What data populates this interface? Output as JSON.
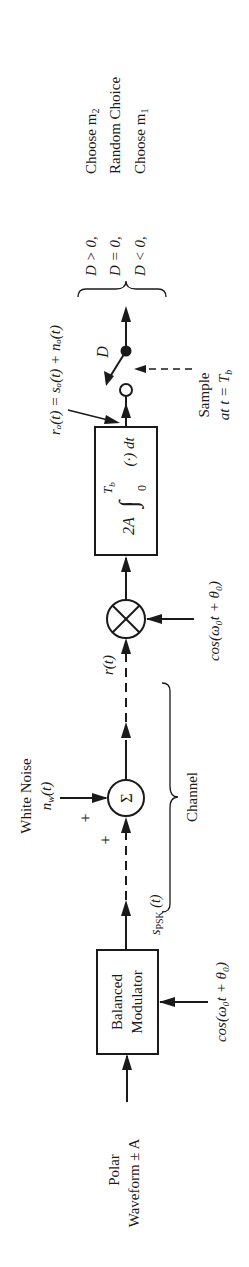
{
  "figure": {
    "orientation": "rotated-90-ccw",
    "input": {
      "label_line1": "Polar",
      "label_line2": "Waveform ± A"
    },
    "modulator": {
      "label_line1": "Balanced",
      "label_line2": "Modulator",
      "carrier": "cos(ω₀t + θ₀)"
    },
    "channel": {
      "label": "Channel",
      "transmitted_signal": "s",
      "transmitted_subscript": "PSK",
      "transmitted_arg": " (t)",
      "noise_title": "White Noise",
      "noise_symbol": "n",
      "noise_subscript": "w",
      "noise_arg": "(t)",
      "sum_symbol": "Σ",
      "plus_noise": "+",
      "plus_signal": "+"
    },
    "receiver": {
      "received_signal": "r(t)",
      "multiplier_carrier": "cos(ω₀t + θ₀)",
      "integrator_gain": "2A",
      "integrator_expr": "∫",
      "integrator_upper": "T",
      "integrator_upper_sub": "b",
      "integrator_lower": "0",
      "integrator_body": "(·) dt",
      "output_expr": "rₒ(t) = sₒ(t) + nₒ(t)",
      "switch_label": "D",
      "sample_line1": "Sample",
      "sample_line2": "at t = T",
      "sample_sub": "b"
    },
    "decision": {
      "rows": [
        {
          "condition": "D > 0,",
          "result": "Choose m",
          "result_sub": "2"
        },
        {
          "condition": "D = 0,",
          "result": "Random Choice",
          "result_sub": ""
        },
        {
          "condition": "D < 0,",
          "result": "Choose m",
          "result_sub": "1"
        }
      ]
    }
  }
}
